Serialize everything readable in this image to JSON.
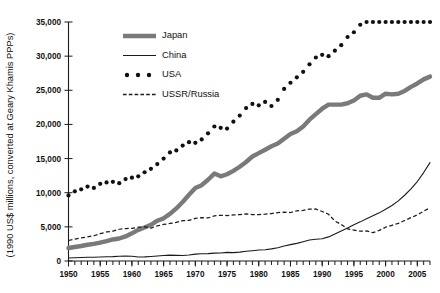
{
  "chart_data": {
    "type": "line",
    "title": "",
    "xlabel": "",
    "ylabel": "(1990 US$ millions, converted at Geary Khamis PPPs)",
    "xlim": [
      1950,
      2007
    ],
    "ylim": [
      0,
      35000
    ],
    "grid": false,
    "legend_position": "upper-left-inside",
    "y_ticks": [
      0,
      5000,
      10000,
      15000,
      20000,
      25000,
      30000,
      35000
    ],
    "y_tick_labels": [
      "0",
      "5,000",
      "10,000",
      "15,000",
      "20,000",
      "25,000",
      "30,000",
      "35,000"
    ],
    "x_ticks": [
      1950,
      1955,
      1960,
      1965,
      1970,
      1975,
      1980,
      1985,
      1990,
      1995,
      2000,
      2005
    ],
    "x_tick_labels": [
      "1950",
      "1955",
      "1960",
      "1965",
      "1970",
      "1975",
      "1980",
      "1985",
      "1990",
      "1995",
      "2000",
      "2005"
    ],
    "x_minor_tick_interval": 1,
    "x": [
      1950,
      1951,
      1952,
      1953,
      1954,
      1955,
      1956,
      1957,
      1958,
      1959,
      1960,
      1961,
      1962,
      1963,
      1964,
      1965,
      1966,
      1967,
      1968,
      1969,
      1970,
      1971,
      1972,
      1973,
      1974,
      1975,
      1976,
      1977,
      1978,
      1979,
      1980,
      1981,
      1982,
      1983,
      1984,
      1985,
      1986,
      1987,
      1988,
      1989,
      1990,
      1991,
      1992,
      1993,
      1994,
      1995,
      1996,
      1997,
      1998,
      1999,
      2000,
      2001,
      2002,
      2003,
      2004,
      2005,
      2006,
      2007
    ],
    "series": [
      {
        "name": "Japan",
        "style": "thick-solid-gray",
        "color": "#7a7a7a",
        "values": [
          1900,
          2050,
          2200,
          2380,
          2500,
          2700,
          2900,
          3150,
          3300,
          3600,
          4050,
          4550,
          4900,
          5300,
          5900,
          6250,
          6900,
          7700,
          8650,
          9700,
          10700,
          11100,
          11900,
          12800,
          12400,
          12700,
          13200,
          13800,
          14500,
          15300,
          15800,
          16300,
          16800,
          17200,
          17900,
          18600,
          19000,
          19700,
          20700,
          21500,
          22300,
          22900,
          22900,
          22900,
          23100,
          23500,
          24200,
          24400,
          23900,
          23900,
          24500,
          24400,
          24500,
          24900,
          25500,
          26000,
          26600,
          27000
        ]
      },
      {
        "name": "China",
        "style": "thin-solid",
        "color": "#1a1a1a",
        "values": [
          450,
          480,
          520,
          540,
          560,
          590,
          620,
          640,
          700,
          720,
          700,
          590,
          610,
          660,
          730,
          800,
          860,
          830,
          810,
          880,
          1000,
          1060,
          1080,
          1160,
          1180,
          1260,
          1230,
          1300,
          1420,
          1510,
          1600,
          1650,
          1780,
          1950,
          2200,
          2400,
          2580,
          2820,
          3080,
          3180,
          3260,
          3530,
          3960,
          4380,
          4830,
          5300,
          5730,
          6190,
          6610,
          7050,
          7580,
          8130,
          8810,
          9630,
          10570,
          11640,
          12950,
          14400
        ]
      },
      {
        "name": "USA",
        "style": "dotted",
        "color": "#111111",
        "values": [
          9600,
          10200,
          10500,
          10900,
          10700,
          11300,
          11500,
          11600,
          11400,
          12000,
          12200,
          12400,
          13000,
          13500,
          14200,
          15000,
          15900,
          16200,
          16900,
          17400,
          17300,
          17800,
          18700,
          19700,
          19500,
          19400,
          20400,
          21300,
          22400,
          23000,
          22800,
          23300,
          22700,
          23600,
          25200,
          26100,
          26900,
          27700,
          28800,
          29800,
          30200,
          30000,
          30800,
          31600,
          32800,
          33500,
          34600,
          35900,
          37200,
          38700,
          40100,
          40200,
          40600,
          41400,
          42700,
          43800,
          44900,
          45500
        ]
      },
      {
        "name": "USSR/Russia",
        "style": "dashed",
        "color": "#1a1a1a",
        "values": [
          3000,
          3200,
          3380,
          3520,
          3700,
          4000,
          4250,
          4380,
          4650,
          4750,
          4780,
          4950,
          5000,
          4820,
          5150,
          5350,
          5500,
          5650,
          5900,
          5950,
          6250,
          6350,
          6300,
          6600,
          6700,
          6650,
          6750,
          6800,
          6900,
          6800,
          6800,
          6850,
          6950,
          7100,
          7150,
          7100,
          7350,
          7400,
          7600,
          7620,
          7250,
          6850,
          5850,
          5350,
          4700,
          4520,
          4360,
          4400,
          4150,
          4480,
          4950,
          5230,
          5500,
          5930,
          6350,
          6760,
          7290,
          7800
        ]
      }
    ]
  },
  "legend": {
    "items": [
      {
        "label": "Japan",
        "marker": "thick-line"
      },
      {
        "label": "China",
        "marker": "thin-line"
      },
      {
        "label": "USA",
        "marker": "dots"
      },
      {
        "label": "USSR/Russia",
        "marker": "dashed-line"
      }
    ]
  }
}
